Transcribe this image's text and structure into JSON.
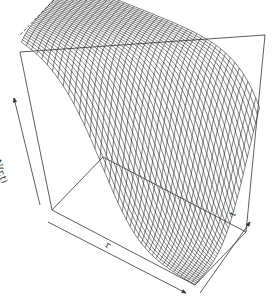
{
  "chart_data": {
    "type": "surface",
    "style": "perspective wireframe (persp)",
    "title": "",
    "xlabel": "r",
    "ylabel": "t",
    "zlabel": "N(r,t)",
    "grid_lines": {
      "r": 40,
      "t": 40
    },
    "x_range": [
      0,
      1
    ],
    "y_range": [
      0,
      1
    ],
    "z_range": [
      0,
      1
    ],
    "ticks": "none",
    "model": "N(r,t) = 1 / (1 + exp(-k*(r_front(t) - r)))",
    "sample_profile_r": [
      0.0,
      0.2,
      0.4,
      0.6,
      0.8,
      1.0
    ],
    "sample_N_at_t0": [
      0.98,
      0.9,
      0.6,
      0.25,
      0.07,
      0.02
    ],
    "sample_N_at_t1": [
      1.0,
      1.0,
      0.98,
      0.9,
      0.6,
      0.3
    ]
  },
  "axes": {
    "z_label": "N(r,t)",
    "x_label": "r",
    "y_label": "t"
  },
  "colors": {
    "mesh": "#1a1a1a",
    "box": "#333333",
    "background": "#ffffff"
  }
}
